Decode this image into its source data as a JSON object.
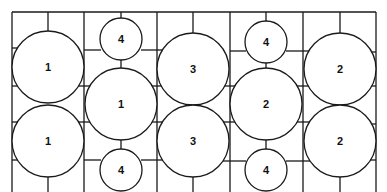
{
  "diagram": {
    "type": "tank-layout",
    "border_color": "#1a1a1a",
    "background": "#ffffff",
    "columns_x": [
      12,
      84,
      157,
      230,
      303,
      376
    ],
    "top_y": 12,
    "circles": [
      {
        "id": "c1",
        "label": "1",
        "cx": 48,
        "cy": 67,
        "r": 36
      },
      {
        "id": "c2",
        "label": "1",
        "cx": 48,
        "cy": 141,
        "r": 36
      },
      {
        "id": "c3",
        "label": "4",
        "cx": 121,
        "cy": 39,
        "r": 21
      },
      {
        "id": "c4",
        "label": "1",
        "cx": 121,
        "cy": 104,
        "r": 36
      },
      {
        "id": "c5",
        "label": "4",
        "cx": 121,
        "cy": 170,
        "r": 21
      },
      {
        "id": "c6",
        "label": "3",
        "cx": 193,
        "cy": 69,
        "r": 36
      },
      {
        "id": "c7",
        "label": "3",
        "cx": 193,
        "cy": 141,
        "r": 36
      },
      {
        "id": "c8",
        "label": "4",
        "cx": 266,
        "cy": 42,
        "r": 21
      },
      {
        "id": "c9",
        "label": "2",
        "cx": 266,
        "cy": 104,
        "r": 36
      },
      {
        "id": "c10",
        "label": "4",
        "cx": 266,
        "cy": 170,
        "r": 21
      },
      {
        "id": "c11",
        "label": "2",
        "cx": 340,
        "cy": 69,
        "r": 36
      },
      {
        "id": "c12",
        "label": "2",
        "cx": 340,
        "cy": 141,
        "r": 36
      }
    ]
  }
}
